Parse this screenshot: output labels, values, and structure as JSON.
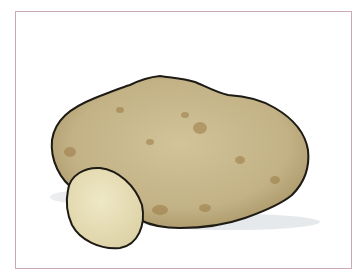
{
  "image": {
    "subject": "potato illustration",
    "elements": [
      "whole potato",
      "potato slice"
    ],
    "colors": {
      "frame_border": "#c9a9b4",
      "potato_skin": "#c7b78a",
      "potato_spots": "#9c7a45",
      "slice_flesh": "#e9e0b8",
      "outline": "#1e1a14",
      "shadow": "#d9dde0"
    }
  }
}
